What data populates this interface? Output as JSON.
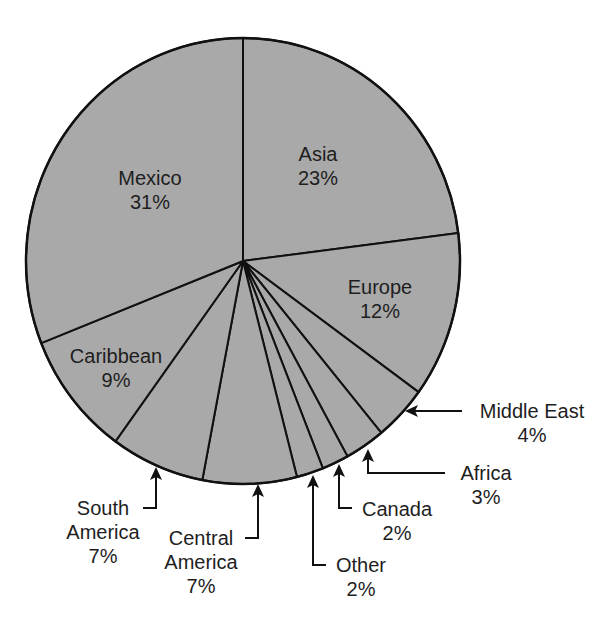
{
  "chart_data": {
    "type": "pie",
    "title": "",
    "start_angle_deg": 0,
    "direction": "clockwise",
    "fill_color": "#a9a9a9",
    "stroke_color": "#111111",
    "slices": [
      {
        "label": "Asia",
        "value": 23,
        "pct_label": "23%",
        "placement": "inside"
      },
      {
        "label": "Europe",
        "value": 12,
        "pct_label": "12%",
        "placement": "inside"
      },
      {
        "label": "Middle East",
        "value": 4,
        "pct_label": "4%",
        "placement": "callout"
      },
      {
        "label": "Africa",
        "value": 3,
        "pct_label": "3%",
        "placement": "callout"
      },
      {
        "label": "Canada",
        "value": 2,
        "pct_label": "2%",
        "placement": "callout"
      },
      {
        "label": "Other",
        "value": 2,
        "pct_label": "2%",
        "placement": "callout"
      },
      {
        "label": "Central America",
        "value": 7,
        "pct_label": "7%",
        "placement": "callout"
      },
      {
        "label": "South America",
        "value": 7,
        "pct_label": "7%",
        "placement": "callout"
      },
      {
        "label": "Caribbean",
        "value": 9,
        "pct_label": "9%",
        "placement": "inside"
      },
      {
        "label": "Mexico",
        "value": 31,
        "pct_label": "31%",
        "placement": "inside"
      }
    ]
  },
  "labels": {
    "asia": {
      "name": "Asia",
      "pct": "23%"
    },
    "europe": {
      "name": "Europe",
      "pct": "12%"
    },
    "mexico": {
      "name": "Mexico",
      "pct": "31%"
    },
    "caribbean": {
      "name": "Caribbean",
      "pct": "9%"
    },
    "middle_east": {
      "name": "Middle East",
      "pct": "4%"
    },
    "africa": {
      "name": "Africa",
      "pct": "3%"
    },
    "canada": {
      "name": "Canada",
      "pct": "2%"
    },
    "other": {
      "name": "Other",
      "pct": "2%"
    },
    "central_america": {
      "line1": "Central",
      "line2": "America",
      "pct": "7%"
    },
    "south_america": {
      "line1": "South",
      "line2": "America",
      "pct": "7%"
    }
  }
}
